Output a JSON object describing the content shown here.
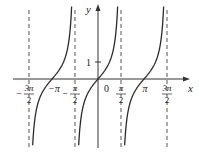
{
  "chart_data": {
    "type": "line",
    "title": "",
    "function": "y = tan x",
    "xlabel": "x",
    "ylabel": "y",
    "origin_label": "0",
    "y_ticks": [
      {
        "value": 1,
        "label": "1"
      }
    ],
    "x_tick_labels": [
      {
        "value": -4.7124,
        "num": "3π",
        "den": "2",
        "sign": "−"
      },
      {
        "value": -3.1416,
        "label": "−π"
      },
      {
        "value": -1.5708,
        "num": "π",
        "den": "2",
        "sign": "−"
      },
      {
        "value": 1.5708,
        "num": "π",
        "den": "2",
        "sign": ""
      },
      {
        "value": 3.1416,
        "label": "π"
      },
      {
        "value": 4.7124,
        "num": "3π",
        "den": "2",
        "sign": ""
      }
    ],
    "asymptotes": [
      -4.7124,
      -1.5708,
      1.5708,
      4.7124
    ],
    "branches": [
      {
        "center": -3.1416,
        "x_range": [
          -4.7124,
          -1.5708
        ]
      },
      {
        "center": 0,
        "x_range": [
          -1.5708,
          1.5708
        ]
      },
      {
        "center": 3.1416,
        "x_range": [
          1.5708,
          4.7124
        ]
      }
    ],
    "sample_points": [
      {
        "x": -3.1416,
        "y": 0
      },
      {
        "x": 0,
        "y": 0
      },
      {
        "x": 3.1416,
        "y": 0
      },
      {
        "x": 0.7854,
        "y": 1
      },
      {
        "x": -0.7854,
        "y": -1
      }
    ],
    "xlim": [
      -5.5,
      5.8
    ],
    "ylim": [
      -4.0,
      4.3
    ],
    "grid": false,
    "legend": null
  },
  "colors": {
    "curve": "#2a2a2a",
    "axis": "#333333",
    "asymptote": "#555555"
  }
}
